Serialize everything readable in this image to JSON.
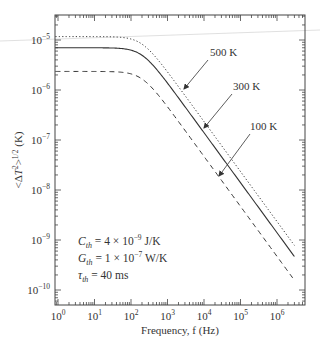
{
  "chart_data": {
    "type": "line",
    "title": "",
    "xlabel": "Frequency, f (Hz)",
    "ylabel": "<ΔT²>^1/2 (K)",
    "xscale": "log",
    "yscale": "log",
    "xlim": [
      0.7,
      4000000
    ],
    "ylim": [
      5e-11,
      3e-05
    ],
    "grid": false,
    "legend": "none (inline arrow annotations)",
    "x_ticks": [
      {
        "value": 1,
        "base": "10",
        "exp": "0"
      },
      {
        "value": 10,
        "base": "10",
        "exp": "1"
      },
      {
        "value": 100,
        "base": "10",
        "exp": "2"
      },
      {
        "value": 1000,
        "base": "10",
        "exp": "3"
      },
      {
        "value": 10000,
        "base": "10",
        "exp": "4"
      },
      {
        "value": 100000,
        "base": "10",
        "exp": "5"
      },
      {
        "value": 1000000,
        "base": "10",
        "exp": "6"
      }
    ],
    "y_ticks": [
      {
        "value": 1e-05,
        "base": "10",
        "exp": "−5"
      },
      {
        "value": 1e-06,
        "base": "10",
        "exp": "−6"
      },
      {
        "value": 1e-07,
        "base": "10",
        "exp": "−7"
      },
      {
        "value": 1e-08,
        "base": "10",
        "exp": "−8"
      },
      {
        "value": 1e-09,
        "base": "10",
        "exp": "−9"
      },
      {
        "value": 1e-10,
        "base": "10",
        "exp": "−10"
      }
    ],
    "model": "v(f) = plateau / sqrt(1 + (f / corner_hz)^2)",
    "corner_hz": 200,
    "f_start": 0.85,
    "f_end": 3000000,
    "series": [
      {
        "name": "500 K",
        "style": "dotted",
        "plateau": 1.17e-05,
        "x": [
          1,
          10,
          100,
          1000,
          10000,
          100000,
          1000000,
          3000000
        ],
        "values": [
          1.17e-05,
          1.17e-05,
          1.05e-05,
          2.3e-06,
          2.3e-07,
          2.3e-08,
          2.3e-09,
          7.8e-10
        ]
      },
      {
        "name": "300 K",
        "style": "solid",
        "plateau": 7e-06,
        "x": [
          1,
          10,
          100,
          1000,
          10000,
          100000,
          1000000,
          3000000
        ],
        "values": [
          7e-06,
          7e-06,
          6.3e-06,
          1.4e-06,
          1.4e-07,
          1.4e-08,
          1.4e-09,
          4.7e-10
        ]
      },
      {
        "name": "100 K",
        "style": "dashed",
        "plateau": 2.35e-06,
        "x": [
          1,
          10,
          100,
          1000,
          10000,
          100000,
          1000000,
          3000000
        ],
        "values": [
          2.35e-06,
          2.35e-06,
          2.1e-06,
          4.6e-07,
          4.7e-08,
          4.7e-09,
          4.7e-10,
          1.6e-10
        ]
      }
    ],
    "annotations": [
      {
        "text": "500 K",
        "label_x": 210,
        "label_y": 56,
        "arrow_from": [
          208,
          60
        ],
        "arrow_to": [
          184,
          89
        ]
      },
      {
        "text": "300 K",
        "label_x": 233,
        "label_y": 90,
        "arrow_from": [
          232,
          94
        ],
        "arrow_to": [
          204,
          128
        ]
      },
      {
        "text": "100 K",
        "label_x": 250,
        "label_y": 130,
        "arrow_from": [
          250,
          134
        ],
        "arrow_to": [
          219,
          176
        ]
      }
    ],
    "parameters": [
      {
        "sym": "C",
        "sub": "th",
        "rhs_pre": " = 4 × 10",
        "exp": "−9",
        "rhs_post": " J/K"
      },
      {
        "sym": "G",
        "sub": "th",
        "rhs_pre": " = 1 × 10",
        "exp": "−7",
        "rhs_post": " W/K"
      },
      {
        "sym": "τ",
        "sub": "th",
        "rhs_pre": " = 40 ms",
        "exp": "",
        "rhs_post": ""
      }
    ]
  }
}
